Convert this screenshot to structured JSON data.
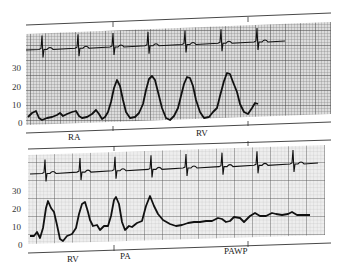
{
  "figure": {
    "colors": {
      "trace": "#111111",
      "grid_fine": "#9a9a9a",
      "grid_major": "#555555",
      "paper": "#e8e8e8",
      "background": "#ffffff"
    }
  },
  "top_panel": {
    "y_axis_labels": [
      "30",
      "20",
      "10",
      "0"
    ],
    "region_labels": [
      "RA",
      "RV"
    ],
    "pressure_trace": [
      [
        28,
        117
      ],
      [
        32,
        113
      ],
      [
        36,
        111
      ],
      [
        39,
        118
      ],
      [
        42,
        120
      ],
      [
        47,
        118
      ],
      [
        52,
        117
      ],
      [
        57,
        115
      ],
      [
        60,
        113
      ],
      [
        63,
        116
      ],
      [
        67,
        114
      ],
      [
        72,
        112
      ],
      [
        76,
        111
      ],
      [
        79,
        116
      ],
      [
        82,
        118
      ],
      [
        87,
        117
      ],
      [
        92,
        114
      ],
      [
        96,
        110
      ],
      [
        99,
        114
      ],
      [
        102,
        119
      ],
      [
        105,
        117
      ],
      [
        108,
        112
      ],
      [
        111,
        102
      ],
      [
        114,
        88
      ],
      [
        117,
        80
      ],
      [
        120,
        86
      ],
      [
        123,
        100
      ],
      [
        126,
        112
      ],
      [
        130,
        118
      ],
      [
        135,
        117
      ],
      [
        139,
        113
      ],
      [
        143,
        104
      ],
      [
        146,
        90
      ],
      [
        149,
        79
      ],
      [
        152,
        76
      ],
      [
        155,
        80
      ],
      [
        158,
        92
      ],
      [
        162,
        108
      ],
      [
        166,
        118
      ],
      [
        170,
        120
      ],
      [
        174,
        116
      ],
      [
        178,
        108
      ],
      [
        181,
        96
      ],
      [
        184,
        84
      ],
      [
        187,
        77
      ],
      [
        190,
        78
      ],
      [
        193,
        86
      ],
      [
        196,
        100
      ],
      [
        200,
        112
      ],
      [
        204,
        118
      ],
      [
        209,
        117
      ],
      [
        213,
        112
      ],
      [
        217,
        108
      ],
      [
        220,
        96
      ],
      [
        224,
        81
      ],
      [
        227,
        73
      ],
      [
        230,
        74
      ],
      [
        233,
        82
      ],
      [
        237,
        92
      ],
      [
        240,
        104
      ],
      [
        244,
        112
      ],
      [
        248,
        114
      ],
      [
        252,
        108
      ],
      [
        255,
        103
      ],
      [
        258,
        104
      ]
    ],
    "ecg_beats_x": [
      42,
      78,
      113,
      148,
      185,
      221,
      257
    ],
    "ecg_baseline": [
      [
        26,
        50
      ],
      [
        285,
        41
      ]
    ]
  },
  "bottom_panel": {
    "y_axis_labels": [
      "30",
      "20",
      "10",
      "0"
    ],
    "region_labels": [
      "RV",
      "PA",
      "PAWP"
    ],
    "pressure_trace": [
      [
        30,
        236
      ],
      [
        34,
        236
      ],
      [
        37,
        232
      ],
      [
        40,
        238
      ],
      [
        43,
        228
      ],
      [
        46,
        208
      ],
      [
        48,
        201
      ],
      [
        51,
        208
      ],
      [
        54,
        212
      ],
      [
        57,
        225
      ],
      [
        60,
        239
      ],
      [
        63,
        241
      ],
      [
        67,
        236
      ],
      [
        72,
        234
      ],
      [
        76,
        228
      ],
      [
        79,
        214
      ],
      [
        82,
        204
      ],
      [
        85,
        202
      ],
      [
        88,
        212
      ],
      [
        90,
        220
      ],
      [
        93,
        226
      ],
      [
        97,
        225
      ],
      [
        100,
        230
      ],
      [
        104,
        226
      ],
      [
        108,
        226
      ],
      [
        111,
        216
      ],
      [
        114,
        200
      ],
      [
        116,
        197
      ],
      [
        119,
        204
      ],
      [
        122,
        222
      ],
      [
        125,
        230
      ],
      [
        129,
        226
      ],
      [
        132,
        227
      ],
      [
        137,
        223
      ],
      [
        142,
        221
      ],
      [
        146,
        206
      ],
      [
        150,
        196
      ],
      [
        154,
        206
      ],
      [
        158,
        214
      ],
      [
        163,
        220
      ],
      [
        170,
        224
      ],
      [
        176,
        226
      ],
      [
        182,
        225
      ],
      [
        188,
        223
      ],
      [
        194,
        222
      ],
      [
        200,
        222
      ],
      [
        206,
        221
      ],
      [
        212,
        221
      ],
      [
        218,
        218
      ],
      [
        222,
        219
      ],
      [
        226,
        222
      ],
      [
        230,
        221
      ],
      [
        234,
        217
      ],
      [
        240,
        218
      ],
      [
        244,
        222
      ],
      [
        250,
        216
      ],
      [
        255,
        213
      ],
      [
        260,
        216
      ],
      [
        266,
        216
      ],
      [
        272,
        213
      ],
      [
        276,
        214
      ],
      [
        282,
        215
      ],
      [
        288,
        214
      ],
      [
        292,
        212
      ],
      [
        297,
        215
      ],
      [
        303,
        215
      ],
      [
        310,
        215
      ]
    ],
    "ecg_beats_x": [
      45,
      80,
      115,
      151,
      186,
      222,
      257,
      293
    ],
    "ecg_baseline": [
      [
        30,
        174
      ],
      [
        318,
        163
      ]
    ]
  }
}
